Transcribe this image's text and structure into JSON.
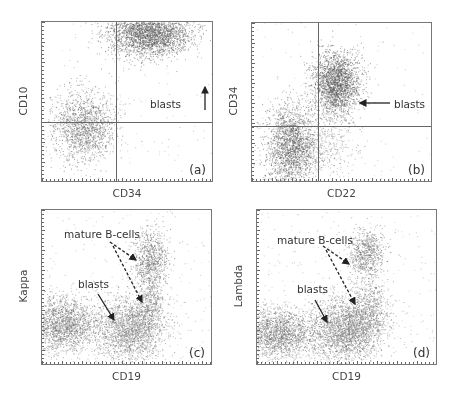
{
  "figure": {
    "panels": [
      {
        "id": "a",
        "label": "(a)",
        "xlabel": "CD34",
        "ylabel": "CD10",
        "box": {
          "x": 41,
          "y": 21,
          "w": 172,
          "h": 161
        },
        "gate": {
          "vx": 74,
          "hy": 100
        },
        "annotations": [
          {
            "text": "blasts",
            "x": 108,
            "y": 76
          }
        ],
        "arrows": [
          {
            "x1": 163,
            "y1": 88,
            "x2": 163,
            "y2": 65,
            "dashed": false
          }
        ],
        "clusters": [
          {
            "cx": 0.63,
            "cy": 0.07,
            "sx": 0.12,
            "sy": 0.07,
            "n": 2600,
            "shade": 95
          },
          {
            "cx": 0.24,
            "cy": 0.66,
            "sx": 0.09,
            "sy": 0.11,
            "n": 1500,
            "shade": 110
          },
          {
            "cx": 0.5,
            "cy": 0.5,
            "sx": 0.5,
            "sy": 0.5,
            "n": 150,
            "shade": 170
          }
        ]
      },
      {
        "id": "b",
        "label": "(b)",
        "xlabel": "CD22",
        "ylabel": "CD34",
        "box": {
          "x": 251,
          "y": 22,
          "w": 181,
          "h": 160
        },
        "gate": {
          "vx": 66,
          "hy": 103
        },
        "annotations": [
          {
            "text": "blasts",
            "x": 142,
            "y": 75
          }
        ],
        "arrows": [
          {
            "x1": 138,
            "y1": 80,
            "x2": 108,
            "y2": 80,
            "dashed": false
          }
        ],
        "clusters": [
          {
            "cx": 0.47,
            "cy": 0.38,
            "sx": 0.065,
            "sy": 0.1,
            "n": 2200,
            "shade": 95
          },
          {
            "cx": 0.22,
            "cy": 0.78,
            "sx": 0.07,
            "sy": 0.13,
            "n": 2000,
            "shade": 100
          },
          {
            "cx": 0.42,
            "cy": 0.78,
            "sx": 0.08,
            "sy": 0.1,
            "n": 350,
            "shade": 140
          },
          {
            "cx": 0.5,
            "cy": 0.5,
            "sx": 0.5,
            "sy": 0.5,
            "n": 150,
            "shade": 170
          }
        ]
      },
      {
        "id": "c",
        "label": "(c)",
        "xlabel": "CD19",
        "ylabel": "Kappa",
        "box": {
          "x": 41,
          "y": 209,
          "w": 171,
          "h": 156
        },
        "gate": null,
        "annotations": [
          {
            "text": "mature B-cells",
            "x": 22,
            "y": 18
          },
          {
            "text": "blasts",
            "x": 36,
            "y": 68
          }
        ],
        "arrows": [
          {
            "x1": 68,
            "y1": 32,
            "x2": 94,
            "y2": 50,
            "dashed": true
          },
          {
            "x1": 71,
            "y1": 36,
            "x2": 100,
            "y2": 92,
            "dashed": true
          },
          {
            "x1": 56,
            "y1": 84,
            "x2": 72,
            "y2": 110,
            "dashed": false
          }
        ],
        "clusters": [
          {
            "cx": 0.52,
            "cy": 0.77,
            "sx": 0.1,
            "sy": 0.1,
            "n": 2400,
            "shade": 140
          },
          {
            "cx": 0.13,
            "cy": 0.74,
            "sx": 0.1,
            "sy": 0.09,
            "n": 1800,
            "shade": 120
          },
          {
            "cx": 0.64,
            "cy": 0.32,
            "sx": 0.05,
            "sy": 0.1,
            "n": 800,
            "shade": 110
          },
          {
            "cx": 0.64,
            "cy": 0.6,
            "sx": 0.04,
            "sy": 0.08,
            "n": 350,
            "shade": 120
          },
          {
            "cx": 0.5,
            "cy": 0.5,
            "sx": 0.5,
            "sy": 0.5,
            "n": 250,
            "shade": 170
          }
        ]
      },
      {
        "id": "d",
        "label": "(d)",
        "xlabel": "CD19",
        "ylabel": "Lambda",
        "box": {
          "x": 256,
          "y": 209,
          "w": 181,
          "h": 156
        },
        "gate": null,
        "annotations": [
          {
            "text": "mature B-cells",
            "x": 20,
            "y": 24
          },
          {
            "text": "blasts",
            "x": 40,
            "y": 73
          }
        ],
        "arrows": [
          {
            "x1": 66,
            "y1": 36,
            "x2": 92,
            "y2": 54,
            "dashed": true
          },
          {
            "x1": 69,
            "y1": 40,
            "x2": 98,
            "y2": 94,
            "dashed": true
          },
          {
            "x1": 58,
            "y1": 90,
            "x2": 70,
            "y2": 112,
            "dashed": false
          }
        ],
        "clusters": [
          {
            "cx": 0.5,
            "cy": 0.77,
            "sx": 0.1,
            "sy": 0.1,
            "n": 2600,
            "shade": 130
          },
          {
            "cx": 0.12,
            "cy": 0.8,
            "sx": 0.1,
            "sy": 0.08,
            "n": 1800,
            "shade": 120
          },
          {
            "cx": 0.61,
            "cy": 0.28,
            "sx": 0.05,
            "sy": 0.08,
            "n": 700,
            "shade": 115
          },
          {
            "cx": 0.63,
            "cy": 0.62,
            "sx": 0.05,
            "sy": 0.1,
            "n": 500,
            "shade": 125
          },
          {
            "cx": 0.5,
            "cy": 0.5,
            "sx": 0.5,
            "sy": 0.5,
            "n": 300,
            "shade": 170
          }
        ]
      }
    ]
  },
  "colors": {
    "axis": "#777777",
    "gate": "#666666",
    "text": "#333333",
    "arrow": "#222222"
  }
}
